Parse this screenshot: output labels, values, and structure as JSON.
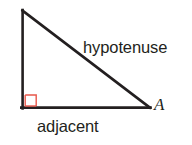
{
  "figure": {
    "kind": "right-triangle-trigonometry-diagram",
    "background_color": "#ffffff",
    "width": 192,
    "height": 145,
    "stroke_color": "#231f20",
    "stroke_width": 2.6,
    "right_angle_marker": {
      "color": "#e8574b",
      "size": 11,
      "stroke_width": 1.4,
      "name": "right-angle-square"
    },
    "vertices": {
      "apex": {
        "x": 22,
        "y": 10
      },
      "right_angle": {
        "x": 22,
        "y": 108
      },
      "angle_a": {
        "x": 150,
        "y": 108
      }
    },
    "sides": {
      "opposite": {
        "from": "apex",
        "to": "right_angle"
      },
      "adjacent": {
        "from": "right_angle",
        "to": "angle_a"
      },
      "hypotenuse": {
        "from": "apex",
        "to": "angle_a"
      }
    }
  },
  "labels": {
    "hypotenuse": "hypotenuse",
    "adjacent": "adjacent",
    "vertex_a": "A"
  }
}
